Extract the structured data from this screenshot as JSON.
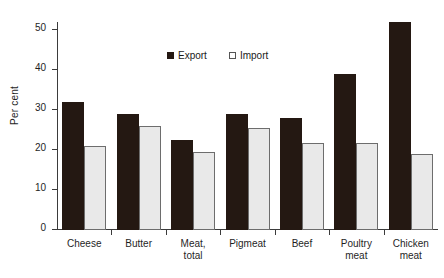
{
  "chart_data": {
    "type": "bar",
    "title": "",
    "xlabel": "",
    "ylabel": "Per cent",
    "ylim": [
      0,
      52
    ],
    "yticks": [
      0,
      10,
      20,
      30,
      40,
      50
    ],
    "ytick_labels": [
      "0",
      "10",
      "20",
      "30",
      "40",
      "50"
    ],
    "grid": false,
    "legend_position": "top-center",
    "categories": [
      "Cheese",
      "Butter",
      "Meat,\ntotal",
      "Pigmeat",
      "Beef",
      "Poultry\nmeat",
      "Chicken\nmeat"
    ],
    "category_lines": [
      [
        "Cheese"
      ],
      [
        "Butter"
      ],
      [
        "Meat,",
        "total"
      ],
      [
        "Pigmeat"
      ],
      [
        "Beef"
      ],
      [
        "Poultry",
        "meat"
      ],
      [
        "Chicken",
        "meat"
      ]
    ],
    "series": [
      {
        "name": "Export",
        "color": "#241812",
        "values": [
          32,
          29,
          22.5,
          29,
          28,
          39,
          52
        ]
      },
      {
        "name": "Import",
        "color": "#e9e9e9",
        "values": [
          21,
          26,
          19.5,
          25.5,
          21.8,
          21.8,
          19
        ]
      }
    ]
  },
  "legend": {
    "items": [
      {
        "label": "Export",
        "style": "export"
      },
      {
        "label": "Import",
        "style": "import"
      }
    ]
  }
}
